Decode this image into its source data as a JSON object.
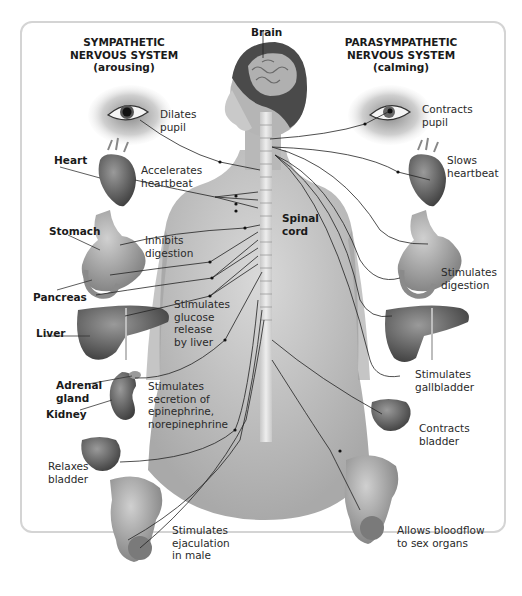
{
  "diagram": {
    "type": "autonomic-nervous-system",
    "left_header": {
      "line1": "SYMPATHETIC",
      "line2": "NERVOUS SYSTEM",
      "line3": "(arousing)"
    },
    "right_header": {
      "line1": "PARASYMPATHETIC",
      "line2": "NERVOUS SYSTEM",
      "line3": "(calming)"
    },
    "center_labels": {
      "brain": "Brain",
      "spinal_cord_1": "Spinal",
      "spinal_cord_2": "cord"
    },
    "organ_labels": {
      "heart": "Heart",
      "stomach": "Stomach",
      "pancreas": "Pancreas",
      "liver": "Liver",
      "adrenal_1": "Adrenal",
      "adrenal_2": "gland",
      "kidney": "Kidney"
    },
    "sympathetic_effects": [
      {
        "organ": "eye",
        "lines": [
          "Dilates",
          "pupil"
        ]
      },
      {
        "organ": "heart",
        "lines": [
          "Accelerates",
          "heartbeat"
        ]
      },
      {
        "organ": "stomach",
        "lines": [
          "Inhibits",
          "digestion"
        ]
      },
      {
        "organ": "liver",
        "lines": [
          "Stimulates",
          "glucose",
          "release",
          "by liver"
        ]
      },
      {
        "organ": "adrenal",
        "lines": [
          "Stimulates",
          "secretion of",
          "epinephrine,",
          "norepinephrine"
        ]
      },
      {
        "organ": "bladder",
        "lines": [
          "Relaxes",
          "bladder"
        ]
      },
      {
        "organ": "sex-organs",
        "lines": [
          "Stimulates",
          "ejaculation",
          "in male"
        ]
      }
    ],
    "parasympathetic_effects": [
      {
        "organ": "eye",
        "lines": [
          "Contracts",
          "pupil"
        ]
      },
      {
        "organ": "heart",
        "lines": [
          "Slows",
          "heartbeat"
        ]
      },
      {
        "organ": "stomach",
        "lines": [
          "Stimulates",
          "digestion"
        ]
      },
      {
        "organ": "gallbladder",
        "lines": [
          "Stimulates",
          "gallbladder"
        ]
      },
      {
        "organ": "bladder",
        "lines": [
          "Contracts",
          "bladder"
        ]
      },
      {
        "organ": "sex-organs",
        "lines": [
          "Allows bloodflow",
          "to sex organs"
        ]
      }
    ]
  }
}
